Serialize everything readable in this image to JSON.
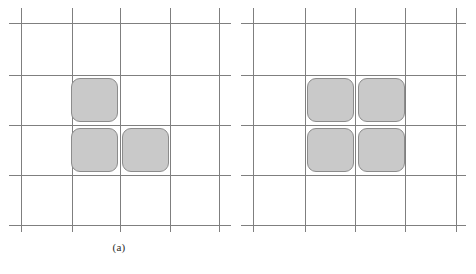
{
  "figure": {
    "width": 476,
    "height": 274,
    "background_color": "#ffffff",
    "colors": {
      "gridline": "#7f7f7f",
      "square_fill": "#c9c9c9",
      "square_border": "#8c8c8c",
      "caption_text": "#2b2b2b"
    }
  },
  "panels": [
    {
      "id": "a",
      "caption": "(a)",
      "origin_x": 0,
      "grid": {
        "vertical_line_x": [
          21,
          72,
          120,
          170,
          219
        ],
        "horizontal_line_y": [
          23,
          75,
          125,
          175,
          225
        ],
        "vertical_span_y": [
          8,
          232
        ],
        "horizontal_span_x": [
          9,
          231
        ],
        "columns": 4,
        "rows": 4
      },
      "squares": [
        {
          "name": "square-a-1",
          "x": 71,
          "y": 78,
          "w": 47,
          "h": 44,
          "row": 1,
          "col": 2
        },
        {
          "name": "square-a-2",
          "x": 71,
          "y": 128,
          "w": 47,
          "h": 44,
          "row": 2,
          "col": 2
        },
        {
          "name": "square-a-3",
          "x": 122,
          "y": 128,
          "w": 47,
          "h": 44,
          "row": 2,
          "col": 3
        }
      ],
      "square_count": 3
    },
    {
      "id": "b",
      "caption": "(b)",
      "origin_x": 238,
      "grid": {
        "vertical_line_x": [
          15,
          67,
          117,
          167,
          218
        ],
        "horizontal_line_y": [
          23,
          75,
          125,
          175,
          225
        ],
        "vertical_span_y": [
          8,
          232
        ],
        "horizontal_span_x": [
          3,
          228
        ],
        "columns": 4,
        "rows": 4
      },
      "squares": [
        {
          "name": "square-b-1",
          "x": 69,
          "y": 78,
          "w": 47,
          "h": 44,
          "row": 1,
          "col": 2
        },
        {
          "name": "square-b-2",
          "x": 120,
          "y": 78,
          "w": 47,
          "h": 44,
          "row": 1,
          "col": 3
        },
        {
          "name": "square-b-3",
          "x": 69,
          "y": 128,
          "w": 47,
          "h": 44,
          "row": 2,
          "col": 2
        },
        {
          "name": "square-b-4",
          "x": 120,
          "y": 128,
          "w": 47,
          "h": 44,
          "row": 2,
          "col": 3
        }
      ],
      "square_count": 4
    }
  ]
}
